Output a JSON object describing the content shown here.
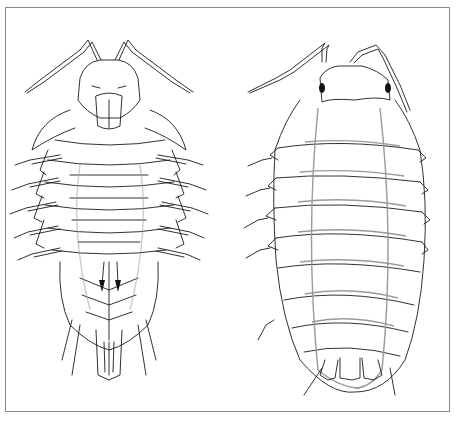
{
  "figure": {
    "panels": [
      {
        "id": "ventral",
        "label": "ventral view"
      },
      {
        "id": "dorsal",
        "label": "dorsal view"
      }
    ],
    "colors": {
      "background": "#ffffff",
      "frame": "#8a8a8a",
      "ink": "#1a1a1a",
      "grey_lines": "#9a9a9a"
    }
  }
}
